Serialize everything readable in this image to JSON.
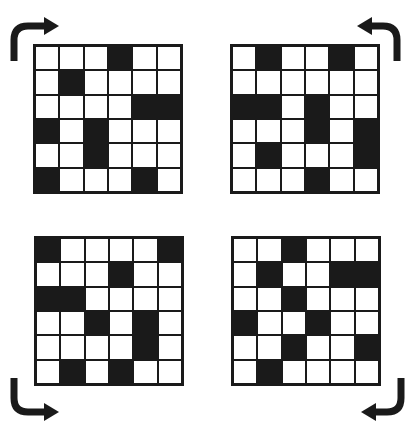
{
  "colors": {
    "filled": "#1a1a1a",
    "empty": "#ffffff",
    "background": "#ffffff"
  },
  "grids": [
    {
      "id": "top-left",
      "position": {
        "x": 33,
        "y": 44
      },
      "rows": [
        [
          0,
          0,
          0,
          1,
          0,
          0
        ],
        [
          0,
          1,
          0,
          0,
          0,
          0
        ],
        [
          0,
          0,
          0,
          0,
          1,
          1
        ],
        [
          1,
          0,
          1,
          0,
          0,
          0
        ],
        [
          0,
          0,
          1,
          0,
          0,
          0
        ],
        [
          1,
          0,
          0,
          0,
          1,
          0
        ]
      ],
      "arrow": "curved-arrow-up-then-right"
    },
    {
      "id": "top-right",
      "position": {
        "x": 230,
        "y": 44
      },
      "rows": [
        [
          0,
          1,
          0,
          0,
          1,
          0
        ],
        [
          0,
          0,
          0,
          0,
          0,
          0
        ],
        [
          1,
          1,
          0,
          1,
          0,
          0
        ],
        [
          0,
          0,
          0,
          1,
          0,
          1
        ],
        [
          0,
          1,
          0,
          0,
          0,
          1
        ],
        [
          0,
          0,
          0,
          1,
          0,
          0
        ]
      ],
      "arrow": "curved-arrow-up-then-left"
    },
    {
      "id": "bottom-left",
      "position": {
        "x": 34,
        "y": 236
      },
      "rows": [
        [
          1,
          0,
          0,
          0,
          0,
          1
        ],
        [
          0,
          0,
          0,
          1,
          0,
          0
        ],
        [
          1,
          1,
          0,
          0,
          0,
          0
        ],
        [
          0,
          0,
          1,
          0,
          1,
          0
        ],
        [
          0,
          0,
          0,
          0,
          1,
          0
        ],
        [
          0,
          1,
          0,
          1,
          0,
          0
        ]
      ],
      "arrow": "curved-arrow-down-then-right"
    },
    {
      "id": "bottom-right",
      "position": {
        "x": 231,
        "y": 236
      },
      "rows": [
        [
          0,
          0,
          1,
          0,
          0,
          0
        ],
        [
          0,
          1,
          0,
          0,
          1,
          1
        ],
        [
          0,
          0,
          1,
          0,
          0,
          0
        ],
        [
          1,
          0,
          0,
          1,
          0,
          0
        ],
        [
          0,
          0,
          1,
          0,
          0,
          1
        ],
        [
          0,
          1,
          0,
          0,
          0,
          0
        ]
      ],
      "arrow": "curved-arrow-down-then-left"
    }
  ]
}
